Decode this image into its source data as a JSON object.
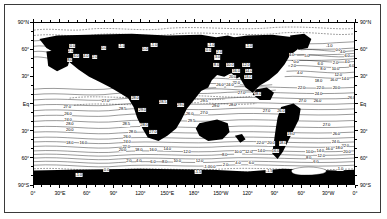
{
  "figure": {
    "type": "contour-map",
    "background_color": "#ffffff",
    "land_color": "#000000",
    "contour_color": "#000000",
    "border_color": "#3a3a3a"
  },
  "axes": {
    "x_labels": [
      "0°",
      "30°E",
      "60°",
      "90°",
      "120°",
      "150°E",
      "180°",
      "150°W",
      "120°",
      "90°",
      "60°",
      "30°W",
      "0°"
    ],
    "y_labels": [
      "90°N",
      "60°",
      "30°",
      "Eq",
      "30°",
      "60°",
      "90°S"
    ],
    "x_range": [
      0,
      360
    ],
    "y_range": [
      -90,
      90
    ],
    "x_tick_interval_deg": 30,
    "x_minor_tick_interval_deg": 10,
    "y_tick_interval_deg": 30,
    "y_minor_tick_interval_deg": 10
  },
  "chart_data": {
    "type": "contour",
    "title": "",
    "xlabel": "",
    "ylabel": "",
    "units": "degrees Celsius",
    "contour_interval": 2.0,
    "contour_levels": [
      -1.5,
      -1.0,
      0.0,
      2.0,
      4.0,
      5.0,
      6.0,
      8.0,
      10.0,
      12.0,
      14.0,
      16.0,
      18.0,
      20.0,
      22.0,
      24.0,
      25.0,
      26.0,
      27.0,
      28.0,
      28.5,
      29.0,
      29.5
    ],
    "min_labeled_value": -1.5,
    "max_labeled_value": 29.5,
    "dashed_levels": [
      -1.5,
      -1.0,
      0.0,
      28.5,
      29.0,
      29.5
    ],
    "labels": [
      {
        "text": "0.0",
        "x": 43,
        "y": 25
      },
      {
        "text": "2.0",
        "x": 41,
        "y": 31
      },
      {
        "text": "6.0",
        "x": 47,
        "y": 36
      },
      {
        "text": "4.0",
        "x": 58,
        "y": 36
      },
      {
        "text": "2.0",
        "x": 68,
        "y": 37
      },
      {
        "text": "8.0",
        "x": 40,
        "y": 41
      },
      {
        "text": "0.0",
        "x": 78,
        "y": 28
      },
      {
        "text": "-1.0",
        "x": 98,
        "y": 25
      },
      {
        "text": "-1.0",
        "x": 134,
        "y": 24
      },
      {
        "text": "0.0",
        "x": 124,
        "y": 29
      },
      {
        "text": "-1.0",
        "x": 198,
        "y": 24
      },
      {
        "text": "0.0",
        "x": 195,
        "y": 30
      },
      {
        "text": "-1.0",
        "x": 240,
        "y": 25
      },
      {
        "text": "-1.0",
        "x": 330,
        "y": 25
      },
      {
        "text": "0.0",
        "x": 340,
        "y": 30
      },
      {
        "text": "2.0",
        "x": 207,
        "y": 32
      },
      {
        "text": "3.0",
        "x": 205,
        "y": 38
      },
      {
        "text": "4.0",
        "x": 288,
        "y": 35
      },
      {
        "text": "5.0",
        "x": 305,
        "y": 36
      },
      {
        "text": "4.0",
        "x": 345,
        "y": 32
      },
      {
        "text": "6.0",
        "x": 350,
        "y": 36
      },
      {
        "text": "0.0",
        "x": 293,
        "y": 43
      },
      {
        "text": "2.0",
        "x": 290,
        "y": 48
      },
      {
        "text": "4.0",
        "x": 297,
        "y": 55
      },
      {
        "text": "6.0",
        "x": 320,
        "y": 45
      },
      {
        "text": "2.0",
        "x": 337,
        "y": 44
      },
      {
        "text": "4.0",
        "x": 350,
        "y": 43
      },
      {
        "text": "6.0",
        "x": 355,
        "y": 47
      },
      {
        "text": "8.0",
        "x": 323,
        "y": 51
      },
      {
        "text": "10.0",
        "x": 337,
        "y": 51
      },
      {
        "text": "12.0",
        "x": 340,
        "y": 57
      },
      {
        "text": "14.0",
        "x": 348,
        "y": 62
      },
      {
        "text": "16.0",
        "x": 335,
        "y": 63
      },
      {
        "text": "18.0",
        "x": 318,
        "y": 64
      },
      {
        "text": "8.0",
        "x": 204,
        "y": 46
      },
      {
        "text": "10.0",
        "x": 219,
        "y": 46
      },
      {
        "text": "12.0",
        "x": 237,
        "y": 46
      },
      {
        "text": "16.0",
        "x": 226,
        "y": 53
      },
      {
        "text": "14.0",
        "x": 240,
        "y": 53
      },
      {
        "text": "20.0",
        "x": 222,
        "y": 60
      },
      {
        "text": "18.0",
        "x": 239,
        "y": 60
      },
      {
        "text": "22.0",
        "x": 226,
        "y": 66
      },
      {
        "text": "24.0",
        "x": 219,
        "y": 69
      },
      {
        "text": "26.0",
        "x": 208,
        "y": 69
      },
      {
        "text": "27.0",
        "x": 232,
        "y": 77
      },
      {
        "text": "28.0",
        "x": 250,
        "y": 78
      },
      {
        "text": "22.0",
        "x": 299,
        "y": 72
      },
      {
        "text": "22.0",
        "x": 320,
        "y": 72
      },
      {
        "text": "20.0",
        "x": 338,
        "y": 72
      },
      {
        "text": "24.0",
        "x": 318,
        "y": 78
      },
      {
        "text": "27.0",
        "x": 300,
        "y": 86
      },
      {
        "text": "26.0",
        "x": 317,
        "y": 86
      },
      {
        "text": "26.0",
        "x": 355,
        "y": 83
      },
      {
        "text": "27.0",
        "x": 80,
        "y": 86
      },
      {
        "text": "28.0",
        "x": 113,
        "y": 83
      },
      {
        "text": "28.5",
        "x": 99,
        "y": 95
      },
      {
        "text": "29.0",
        "x": 121,
        "y": 96
      },
      {
        "text": "28.5",
        "x": 144,
        "y": 87
      },
      {
        "text": "29.0",
        "x": 164,
        "y": 91
      },
      {
        "text": "29.5",
        "x": 190,
        "y": 86
      },
      {
        "text": "26.0",
        "x": 174,
        "y": 100
      },
      {
        "text": "27.0",
        "x": 190,
        "y": 99
      },
      {
        "text": "29.0",
        "x": 203,
        "y": 92
      },
      {
        "text": "28.0",
        "x": 222,
        "y": 90
      },
      {
        "text": "27.0",
        "x": 260,
        "y": 97
      },
      {
        "text": "26.0",
        "x": 276,
        "y": 97
      },
      {
        "text": "27.0",
        "x": 37,
        "y": 93
      },
      {
        "text": "26.0",
        "x": 38,
        "y": 100
      },
      {
        "text": "28.0",
        "x": 40,
        "y": 111
      },
      {
        "text": "24.0",
        "x": 38,
        "y": 107
      },
      {
        "text": "20.0",
        "x": 40,
        "y": 118
      },
      {
        "text": "18.0",
        "x": 40,
        "y": 132
      },
      {
        "text": "16.0",
        "x": 55,
        "y": 132
      },
      {
        "text": "28.5",
        "x": 103,
        "y": 112
      },
      {
        "text": "28.0",
        "x": 123,
        "y": 113
      },
      {
        "text": "28.0",
        "x": 110,
        "y": 120
      },
      {
        "text": "27.0",
        "x": 133,
        "y": 120
      },
      {
        "text": "26.0",
        "x": 104,
        "y": 126
      },
      {
        "text": "24.0",
        "x": 104,
        "y": 131
      },
      {
        "text": "22.0",
        "x": 103,
        "y": 137
      },
      {
        "text": "20.0",
        "x": 99,
        "y": 140
      },
      {
        "text": "18.0",
        "x": 117,
        "y": 140
      },
      {
        "text": "16.0",
        "x": 133,
        "y": 140
      },
      {
        "text": "14.0",
        "x": 149,
        "y": 139
      },
      {
        "text": "12.0",
        "x": 171,
        "y": 142
      },
      {
        "text": "29.5",
        "x": 176,
        "y": 108
      },
      {
        "text": "2.0",
        "x": 106,
        "y": 152
      },
      {
        "text": "4.0",
        "x": 117,
        "y": 152
      },
      {
        "text": "6.0",
        "x": 133,
        "y": 153
      },
      {
        "text": "8.0",
        "x": 146,
        "y": 153
      },
      {
        "text": "10.0",
        "x": 160,
        "y": 152
      },
      {
        "text": "12.0",
        "x": 185,
        "y": 152
      },
      {
        "text": "0.0",
        "x": 81,
        "y": 162
      },
      {
        "text": "-1.0",
        "x": 50,
        "y": 168
      },
      {
        "text": "22.0",
        "x": 253,
        "y": 132
      },
      {
        "text": "20.0",
        "x": 265,
        "y": 133
      },
      {
        "text": "18.0",
        "x": 278,
        "y": 133
      },
      {
        "text": "14.0",
        "x": 254,
        "y": 141
      },
      {
        "text": "16.0",
        "x": 270,
        "y": 141
      },
      {
        "text": "12.0",
        "x": 240,
        "y": 142
      },
      {
        "text": "10.0",
        "x": 228,
        "y": 143
      },
      {
        "text": "8.0",
        "x": 213,
        "y": 146
      },
      {
        "text": "19.0",
        "x": 287,
        "y": 123
      },
      {
        "text": "27.0",
        "x": 327,
        "y": 113
      },
      {
        "text": "26.0",
        "x": 338,
        "y": 123
      },
      {
        "text": "24.0",
        "x": 337,
        "y": 131
      },
      {
        "text": "22.0",
        "x": 348,
        "y": 136
      },
      {
        "text": "20.0",
        "x": 350,
        "y": 142
      },
      {
        "text": "10.0",
        "x": 308,
        "y": 143
      },
      {
        "text": "14.0",
        "x": 320,
        "y": 141
      },
      {
        "text": "16.0",
        "x": 330,
        "y": 139
      },
      {
        "text": "18.0",
        "x": 341,
        "y": 138
      },
      {
        "text": "8.0",
        "x": 307,
        "y": 149
      },
      {
        "text": "12.0",
        "x": 321,
        "y": 147
      },
      {
        "text": "6.0",
        "x": 315,
        "y": 153
      },
      {
        "text": "2.0",
        "x": 214,
        "y": 157
      },
      {
        "text": "4.0",
        "x": 228,
        "y": 155
      },
      {
        "text": "6.0",
        "x": 243,
        "y": 155
      },
      {
        "text": "0.0",
        "x": 200,
        "y": 159
      },
      {
        "text": "-1.0",
        "x": 193,
        "y": 159
      },
      {
        "text": "-1.5",
        "x": 183,
        "y": 164
      },
      {
        "text": "-1.5",
        "x": 263,
        "y": 163
      },
      {
        "text": "-1.0",
        "x": 342,
        "y": 161
      }
    ]
  }
}
